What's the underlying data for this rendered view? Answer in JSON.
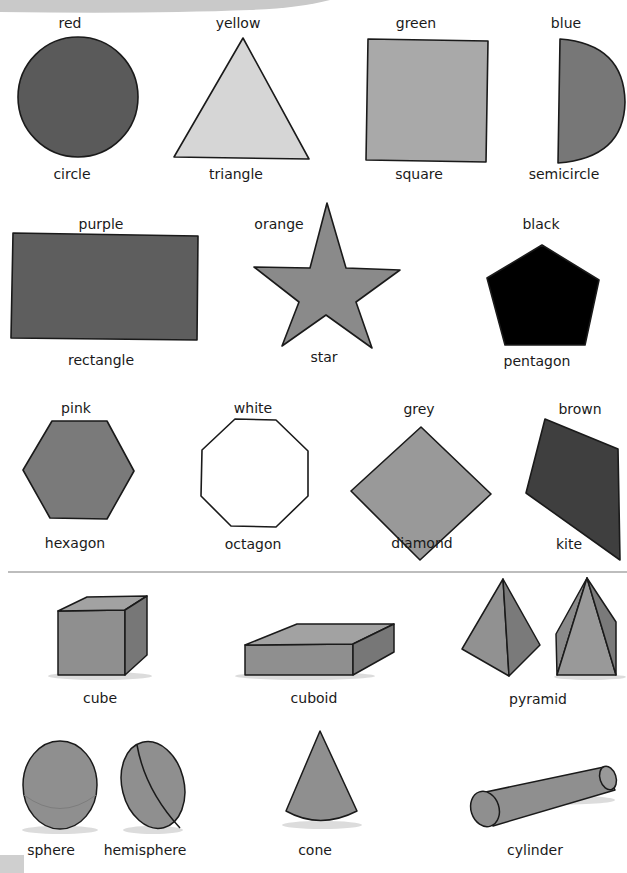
{
  "page": {
    "sections": [
      "2d-shapes-and-colours",
      "3d-solids"
    ]
  },
  "flat_shapes": [
    {
      "id": "circle",
      "colour": "red",
      "name": "circle",
      "fill": "#5a5a5a"
    },
    {
      "id": "triangle",
      "colour": "yellow",
      "name": "triangle",
      "fill": "#d6d6d6"
    },
    {
      "id": "square",
      "colour": "green",
      "name": "square",
      "fill": "#a9a9a9"
    },
    {
      "id": "semicircle",
      "colour": "blue",
      "name": "semicircle",
      "fill": "#777777"
    },
    {
      "id": "rectangle",
      "colour": "purple",
      "name": "rectangle",
      "fill": "#5e5e5e"
    },
    {
      "id": "star",
      "colour": "orange",
      "name": "star",
      "fill": "#8a8a8a"
    },
    {
      "id": "pentagon",
      "colour": "black",
      "name": "pentagon",
      "fill": "#000000"
    },
    {
      "id": "hexagon",
      "colour": "pink",
      "name": "hexagon",
      "fill": "#7a7a7a"
    },
    {
      "id": "octagon",
      "colour": "white",
      "name": "octagon",
      "fill": "#ffffff"
    },
    {
      "id": "diamond",
      "colour": "grey",
      "name": "diamond",
      "fill": "#999999"
    },
    {
      "id": "kite",
      "colour": "brown",
      "name": "kite",
      "fill": "#3f3f3f"
    }
  ],
  "solids": [
    {
      "id": "cube",
      "name": "cube"
    },
    {
      "id": "cuboid",
      "name": "cuboid"
    },
    {
      "id": "pyramid",
      "name": "pyramid"
    },
    {
      "id": "sphere",
      "name": "sphere"
    },
    {
      "id": "hemisphere",
      "name": "hemisphere"
    },
    {
      "id": "cone",
      "name": "cone"
    },
    {
      "id": "cylinder",
      "name": "cylinder"
    }
  ],
  "colors": {
    "banner": "#c9c9c9",
    "separator": "#bdbdbd",
    "outline": "#1a1a1a",
    "solid_face": "#8f8f8f",
    "solid_side": "#777777",
    "solid_top": "#a2a2a2"
  }
}
